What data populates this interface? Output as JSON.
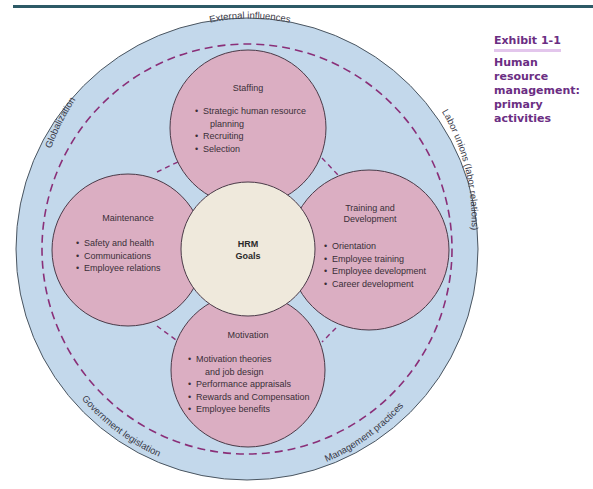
{
  "exhibit": {
    "number": "Exhibit 1-1",
    "title": "Human resource management: primary activities"
  },
  "outer_ring": {
    "labels": {
      "top": "External influences",
      "left": "Globalization",
      "right": "Labor unions (labor relations)",
      "bottom_left": "Government legislation",
      "bottom_right": "Management practices"
    }
  },
  "center": {
    "line1": "HRM",
    "line2": "Goals"
  },
  "activities": {
    "staffing": {
      "title": "Staffing",
      "items": [
        "Strategic human resource",
        "planning",
        "Recruiting",
        "Selection"
      ]
    },
    "maintenance": {
      "title": "Maintenance",
      "items": [
        "Safety and health",
        "Communications",
        "Employee relations"
      ]
    },
    "training": {
      "title_line1": "Training and",
      "title_line2": "Development",
      "items": [
        "Orientation",
        "Employee training",
        "Employee development",
        "Career development"
      ]
    },
    "motivation": {
      "title": "Motivation",
      "items": [
        "Motivation theories",
        "and job design",
        "Performance appraisals",
        "Rewards and Compensation",
        "Employee benefits"
      ]
    }
  },
  "colors": {
    "outer": "#c3d8eb",
    "activity": "#dbaec2",
    "center": "#efe9dc",
    "dashed": "#8a2f78",
    "accent": "#6b2e83"
  }
}
